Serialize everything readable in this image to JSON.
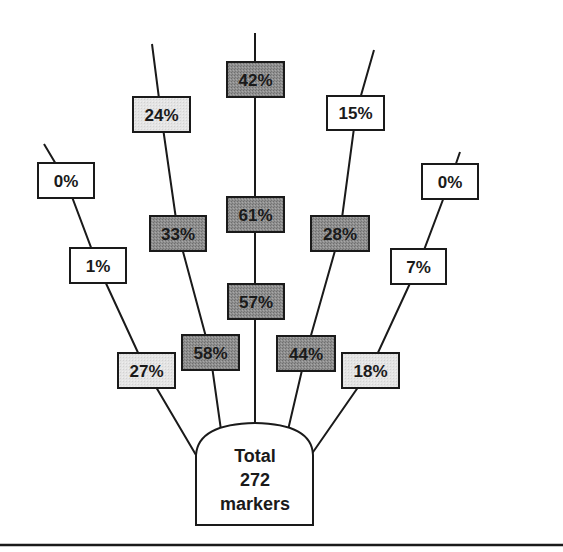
{
  "colors": {
    "white": "#ffffff",
    "light": "#e2e2e2",
    "dark": "#8a8a8a",
    "stroke": "#1a1a1a"
  },
  "total": {
    "line1": "Total",
    "line2": "272",
    "line3": "markers"
  },
  "branches": [
    {
      "id": "far-left",
      "boxes": [
        {
          "label": "27%",
          "shade": "light"
        },
        {
          "label": "1%",
          "shade": "white"
        },
        {
          "label": "0%",
          "shade": "white"
        }
      ]
    },
    {
      "id": "inner-left",
      "boxes": [
        {
          "label": "58%",
          "shade": "dark"
        },
        {
          "label": "33%",
          "shade": "dark"
        },
        {
          "label": "24%",
          "shade": "light"
        }
      ]
    },
    {
      "id": "center",
      "boxes": [
        {
          "label": "57%",
          "shade": "dark"
        },
        {
          "label": "61%",
          "shade": "dark"
        },
        {
          "label": "42%",
          "shade": "dark"
        }
      ]
    },
    {
      "id": "inner-right",
      "boxes": [
        {
          "label": "44%",
          "shade": "dark"
        },
        {
          "label": "28%",
          "shade": "dark"
        },
        {
          "label": "15%",
          "shade": "white"
        }
      ]
    },
    {
      "id": "far-right",
      "boxes": [
        {
          "label": "18%",
          "shade": "light"
        },
        {
          "label": "7%",
          "shade": "white"
        },
        {
          "label": "0%",
          "shade": "white"
        }
      ]
    }
  ]
}
